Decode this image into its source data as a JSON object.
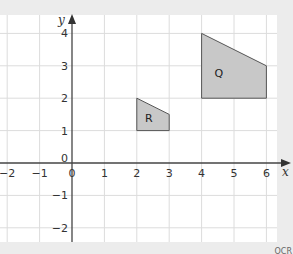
{
  "diagram": {
    "type": "coordinate-grid",
    "axes": {
      "x_label": "x",
      "y_label": "y",
      "x_ticks": [
        "−2",
        "−1",
        "0",
        "1",
        "2",
        "3",
        "4",
        "5",
        "6"
      ],
      "y_ticks": [
        "4",
        "3",
        "2",
        "1",
        "0",
        "−1",
        "−2"
      ],
      "x_range": [
        -2,
        6
      ],
      "y_range": [
        -2,
        4
      ]
    },
    "shapes": [
      {
        "label": "R",
        "vertices": [
          [
            2,
            1
          ],
          [
            2,
            2
          ],
          [
            3,
            1.5
          ],
          [
            3,
            1
          ]
        ],
        "fill": "#c8c8c8"
      },
      {
        "label": "Q",
        "vertices": [
          [
            4,
            2
          ],
          [
            4,
            4
          ],
          [
            6,
            3
          ],
          [
            6,
            2
          ]
        ],
        "fill": "#c8c8c8"
      }
    ],
    "credit": "OCR"
  }
}
